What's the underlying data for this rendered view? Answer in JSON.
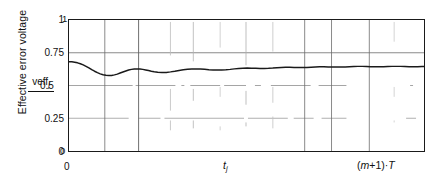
{
  "chart_data": {
    "type": "line",
    "title": "",
    "subtitle": "",
    "ylabel": "Effective error voltage",
    "y_symbol": "veff",
    "y_symbol_sub": "j",
    "xlabel": "",
    "x_tick_labels": [
      "0",
      "tj",
      "(m+1)·T"
    ],
    "x_left_label": "0",
    "x_mid_label_base": "t",
    "x_mid_label_sub": "j",
    "x_right_label_open": "(",
    "x_right_label_m": "m",
    "x_right_label_plus1": "+1)·",
    "x_right_label_T": "T",
    "y_tick_labels": [
      "0",
      "0.25",
      "0.5",
      "0.75",
      "1"
    ],
    "y_tick_values": [
      0,
      0.25,
      0.5,
      0.75,
      1
    ],
    "y_dup_top": "1",
    "y_dup_bottom": "0",
    "ylim": [
      0,
      1
    ],
    "xlim": [
      0,
      1
    ],
    "grid": true,
    "grid_horizontal_at": [
      0.25,
      0.5,
      0.75
    ],
    "grid_vertical_solid_at": [
      0.1,
      0.195,
      0.665,
      0.74,
      0.845
    ],
    "grid_vertical_faint_at": [
      0.285,
      0.35,
      0.425,
      0.5,
      0.575,
      0.915
    ],
    "legend": "none",
    "series": [
      {
        "name": "effective error voltage",
        "color": "#1a1a1a",
        "x": [
          0.0,
          0.008,
          0.016,
          0.024,
          0.032,
          0.04,
          0.048,
          0.056,
          0.064,
          0.072,
          0.08,
          0.088,
          0.096,
          0.104,
          0.112,
          0.12,
          0.128,
          0.136,
          0.144,
          0.152,
          0.16,
          0.168,
          0.176,
          0.184,
          0.192,
          0.2,
          0.208,
          0.216,
          0.224,
          0.232,
          0.24,
          0.25,
          0.262,
          0.274,
          0.286,
          0.298,
          0.31,
          0.322,
          0.334,
          0.346,
          0.358,
          0.37,
          0.382,
          0.394,
          0.406,
          0.418,
          0.43,
          0.442,
          0.454,
          0.466,
          0.478,
          0.49,
          0.502,
          0.514,
          0.526,
          0.538,
          0.55,
          0.562,
          0.574,
          0.586,
          0.598,
          0.61,
          0.622,
          0.634,
          0.646,
          0.658,
          0.67,
          0.682,
          0.694,
          0.706,
          0.718,
          0.73,
          0.742,
          0.754,
          0.766,
          0.778,
          0.79,
          0.802,
          0.814,
          0.826,
          0.838,
          0.85,
          0.862,
          0.874,
          0.886,
          0.898,
          0.91,
          0.922,
          0.934,
          0.946,
          0.958,
          0.97,
          0.982,
          0.994,
          1.0
        ],
        "y": [
          0.682,
          0.681,
          0.678,
          0.673,
          0.666,
          0.657,
          0.646,
          0.634,
          0.621,
          0.609,
          0.598,
          0.589,
          0.582,
          0.578,
          0.576,
          0.577,
          0.581,
          0.587,
          0.595,
          0.603,
          0.611,
          0.618,
          0.623,
          0.626,
          0.627,
          0.626,
          0.623,
          0.619,
          0.614,
          0.609,
          0.605,
          0.601,
          0.599,
          0.6,
          0.604,
          0.609,
          0.615,
          0.62,
          0.624,
          0.626,
          0.627,
          0.626,
          0.624,
          0.621,
          0.619,
          0.618,
          0.618,
          0.62,
          0.623,
          0.627,
          0.63,
          0.632,
          0.633,
          0.632,
          0.631,
          0.63,
          0.63,
          0.631,
          0.633,
          0.636,
          0.638,
          0.639,
          0.639,
          0.638,
          0.637,
          0.637,
          0.638,
          0.64,
          0.642,
          0.643,
          0.643,
          0.642,
          0.641,
          0.641,
          0.641,
          0.642,
          0.644,
          0.645,
          0.646,
          0.646,
          0.645,
          0.644,
          0.643,
          0.643,
          0.644,
          0.645,
          0.646,
          0.646,
          0.646,
          0.645,
          0.644,
          0.644,
          0.644,
          0.645,
          0.645
        ]
      }
    ]
  }
}
